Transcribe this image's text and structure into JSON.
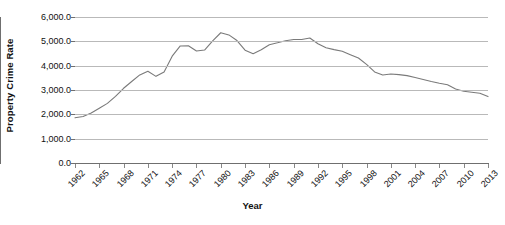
{
  "chart_data": {
    "type": "line",
    "title": "",
    "xlabel": "Year",
    "ylabel": "Property Crime Rate",
    "xlim": [
      1962,
      2013
    ],
    "ylim": [
      0,
      6000
    ],
    "grid": true,
    "legend": false,
    "line_color": "#7a7a7a",
    "gridline_color": "#b9b9b9",
    "axis_color": "#6f6f6f",
    "y_ticks": [
      0,
      1000,
      2000,
      3000,
      4000,
      5000,
      6000
    ],
    "y_tick_labels": [
      "0.0",
      "1,000.0",
      "2,000.0",
      "3,000.0",
      "4,000.0",
      "5,000.0",
      "6,000.0"
    ],
    "x_tick_labels": [
      "1962",
      "1965",
      "1968",
      "1971",
      "1974",
      "1977",
      "1980",
      "1983",
      "1986",
      "1989",
      "1992",
      "1995",
      "1998",
      "2001",
      "2004",
      "2007",
      "2010",
      "2013"
    ],
    "x": [
      1962,
      1963,
      1964,
      1965,
      1966,
      1967,
      1968,
      1969,
      1970,
      1971,
      1972,
      1973,
      1974,
      1975,
      1976,
      1977,
      1978,
      1979,
      1980,
      1981,
      1982,
      1983,
      1984,
      1985,
      1986,
      1987,
      1988,
      1989,
      1990,
      1991,
      1992,
      1993,
      1994,
      1995,
      1996,
      1997,
      1998,
      1999,
      2000,
      2001,
      2002,
      2003,
      2004,
      2005,
      2006,
      2007,
      2008,
      2009,
      2010,
      2011,
      2012,
      2013
    ],
    "values": [
      1857.5,
      1913.0,
      2052.0,
      2249.0,
      2450.0,
      2736.0,
      3071.0,
      3351.0,
      3621.0,
      3769.0,
      3561.0,
      3737.0,
      4389.0,
      4811.0,
      4819.0,
      4602.0,
      4643.0,
      5017.0,
      5353.0,
      5264.0,
      5033.0,
      4637.0,
      4492.0,
      4651.0,
      4863.0,
      4940.0,
      5027.0,
      5078.0,
      5073.0,
      5140.0,
      4903.0,
      4740.0,
      4660.0,
      4591.0,
      4451.0,
      4316.0,
      4053.0,
      3744.0,
      3618.0,
      3658.0,
      3631.0,
      3591.0,
      3514.0,
      3431.0,
      3346.0,
      3276.0,
      3215.0,
      3041.0,
      2946.0,
      2905.0,
      2868.0,
      2730.0
    ]
  },
  "axes": {
    "y_title": "Property Crime Rate",
    "x_title": "Year"
  }
}
